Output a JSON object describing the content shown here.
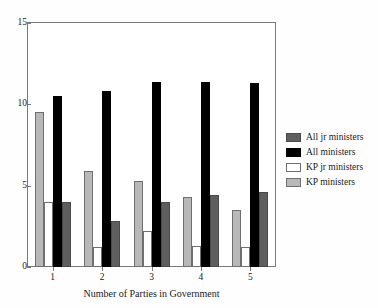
{
  "chart_data": {
    "type": "bar",
    "title": "",
    "subtitle": "",
    "xlabel": "Number of Parties in Government",
    "ylabel": "",
    "categories": [
      "1",
      "2",
      "3",
      "4",
      "5"
    ],
    "ylim": [
      0,
      15
    ],
    "yticks": [
      0,
      5,
      10,
      15
    ],
    "ytick_labels": [
      "0",
      "5",
      "10",
      "15"
    ],
    "xtick_labels": [
      "1",
      "2",
      "3",
      "4",
      "5"
    ],
    "grid": false,
    "legend_position": "right",
    "legend_entries": [
      "All jr ministers",
      "All ministers",
      "KP jr ministers",
      "KP ministers"
    ],
    "series": [
      {
        "name": "KP ministers",
        "color": "#b8b8b8",
        "values": [
          9.5,
          5.9,
          5.3,
          4.3,
          3.5
        ]
      },
      {
        "name": "KP jr ministers",
        "color": "#ffffff",
        "values": [
          4.0,
          1.2,
          2.2,
          1.3,
          1.2
        ]
      },
      {
        "name": "All ministers",
        "color": "#000000",
        "values": [
          10.5,
          10.8,
          11.4,
          11.4,
          11.3
        ]
      },
      {
        "name": "All jr ministers",
        "color": "#5e5e5e",
        "values": [
          4.0,
          2.8,
          4.0,
          4.4,
          4.6
        ]
      }
    ]
  },
  "axis": {
    "y_ticks": [
      "15",
      "10",
      "5",
      "0"
    ],
    "x_ticks": [
      "1",
      "2",
      "3",
      "4",
      "5"
    ],
    "x_label": "Number of Parties in Government"
  },
  "legend": {
    "items": [
      {
        "label": "All jr ministers",
        "swatch": "dark-gray-swatch"
      },
      {
        "label": "All ministers",
        "swatch": "black-swatch"
      },
      {
        "label": "KP jr ministers",
        "swatch": "white-swatch"
      },
      {
        "label": "KP ministers",
        "swatch": "light-gray-swatch"
      }
    ]
  },
  "colors": {
    "all_jr_ministers": "#5e5e5e",
    "all_ministers": "#000000",
    "kp_jr_ministers": "#ffffff",
    "kp_ministers": "#b8b8b8",
    "frame": "#7a7a7a",
    "background": "#fefefe"
  }
}
